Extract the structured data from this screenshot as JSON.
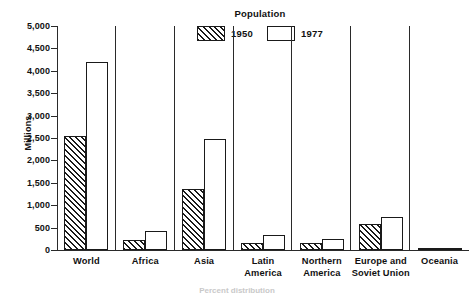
{
  "chart_data": {
    "type": "bar",
    "title": "Population",
    "xlabel": "",
    "ylabel": "Millions",
    "ylim": [
      0,
      5000
    ],
    "ytick_labels": [
      "5,000",
      "4,500",
      "4,000",
      "3,500",
      "3,000",
      "2,500",
      "2,000",
      "1,500",
      "1,000",
      "500",
      "0"
    ],
    "ytick_values": [
      5000,
      4500,
      4000,
      3500,
      3000,
      2500,
      2000,
      1500,
      1000,
      500,
      0
    ],
    "grid": false,
    "legend_position": "top-center",
    "categories": [
      "World",
      "Africa",
      "Asia",
      "Latin\nAmerica",
      "Northern\nAmerica",
      "Europe and\nSoviet Union",
      "Oceania"
    ],
    "series": [
      {
        "name": "1950",
        "fill": "hatched",
        "values": [
          2550,
          220,
          1370,
          165,
          166,
          575,
          13
        ]
      },
      {
        "name": "1977",
        "fill": "white",
        "values": [
          4200,
          430,
          2480,
          338,
          242,
          730,
          22
        ]
      }
    ]
  },
  "legend": {
    "title": "Population",
    "entries": [
      {
        "label": "1950",
        "fill": "hatched"
      },
      {
        "label": "1977",
        "fill": "white"
      }
    ]
  },
  "axis": {
    "y_title": "Millions"
  },
  "footnote": {
    "text": "Percent distribution"
  },
  "colors": {
    "ink": "#1a1a1a",
    "axis": "#2a2a2a",
    "background": "#ffffff"
  }
}
